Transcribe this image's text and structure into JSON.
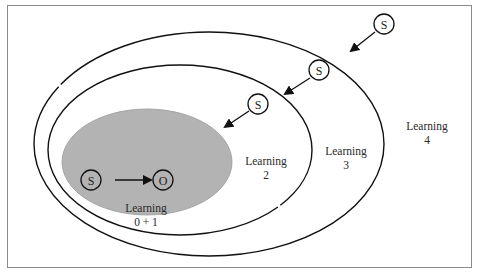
{
  "diagram": {
    "type": "nested-ellipses",
    "colors": {
      "frame": "#8a8a8a",
      "line": "#111111",
      "inner_fill": "#b3b3b3",
      "background": "#ffffff"
    },
    "regions": [
      {
        "id": "learning-0-1",
        "line1": "Learning",
        "line2": "0 + 1"
      },
      {
        "id": "learning-2",
        "line1": "Learning",
        "line2": "2"
      },
      {
        "id": "learning-3",
        "line1": "Learning",
        "line2": "3"
      },
      {
        "id": "learning-4",
        "line1": "Learning",
        "line2": "4"
      }
    ],
    "nodes": {
      "inner_s": "S",
      "inner_o": "O",
      "s_outer": "S",
      "s_middle": "S",
      "s_inner": "S"
    }
  }
}
